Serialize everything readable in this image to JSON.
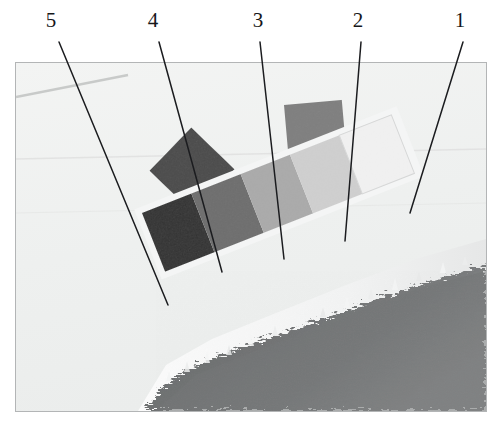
{
  "figure": {
    "type": "annotated-photograph",
    "panel": {
      "x": 15,
      "y": 62,
      "width": 472,
      "height": 350,
      "border_color": "#b3b5b6",
      "background_color": "#eff0ef"
    },
    "callouts": [
      {
        "label": "5",
        "label_x": 38,
        "label_y": 10,
        "line_x1": 59,
        "line_y1": 42,
        "line_x2": 168,
        "line_y2": 305
      },
      {
        "label": "4",
        "label_x": 140,
        "label_y": 10,
        "line_x1": 159,
        "line_y1": 42,
        "line_x2": 222,
        "line_y2": 272
      },
      {
        "label": "3",
        "label_x": 245,
        "label_y": 10,
        "line_x1": 260,
        "line_y1": 42,
        "line_x2": 284,
        "line_y2": 259
      },
      {
        "label": "2",
        "label_x": 345,
        "label_y": 10,
        "line_x1": 361,
        "line_y1": 42,
        "line_x2": 345,
        "line_y2": 241
      },
      {
        "label": "1",
        "label_x": 447,
        "label_y": 10,
        "line_x1": 463,
        "line_y1": 42,
        "line_x2": 410,
        "line_y2": 213
      }
    ],
    "scene": {
      "sky_color": "#eff0ef",
      "water_color": "#eceded",
      "ground_color": "#6b6d6e",
      "ground_fringe_color": "#f3f4f4",
      "horizon_line_color": "#c8cac9"
    },
    "grey_scale_strip": {
      "description": "Slanted calibration strip of five grey patches, dark at left to white at right",
      "patches": [
        {
          "index": 5,
          "color": "#2d2d2d",
          "name": "patch-darkest"
        },
        {
          "index": 4,
          "color": "#6b6b6b",
          "name": "patch-dark-mid"
        },
        {
          "index": 3,
          "color": "#a9a9a9",
          "name": "patch-mid"
        },
        {
          "index": 2,
          "color": "#cfcfcf",
          "name": "patch-light-mid"
        },
        {
          "index": 1,
          "color": "#f1f1f1",
          "name": "patch-lightest"
        }
      ]
    },
    "floating_squares": [
      {
        "name": "dark-diamond",
        "color": "#474747",
        "rotation_deg": 45
      },
      {
        "name": "grey-square",
        "color": "#7d7d7d",
        "rotation_deg": -6
      }
    ]
  },
  "chart_data": {
    "type": "table",
    "categories": [
      "5",
      "4",
      "3",
      "2",
      "1"
    ],
    "values": [
      45,
      107,
      169,
      207,
      241
    ],
    "xlabel": "Target number",
    "ylabel": "Grey level (0-255)",
    "ylim": [
      0,
      255
    ],
    "annotations": [
      "Target 5 is the darkest patch",
      "Target 1 is the brightest (near white) patch",
      "Targets are arranged left-to-right in decreasing density"
    ]
  }
}
